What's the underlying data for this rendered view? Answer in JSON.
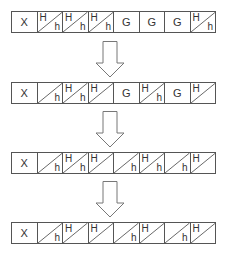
{
  "diagram": {
    "rows": [
      {
        "cells": [
          {
            "type": "full",
            "label": "X"
          },
          {
            "type": "split",
            "upper": "H",
            "lower": "h"
          },
          {
            "type": "split",
            "upper": "H",
            "lower": "h"
          },
          {
            "type": "split",
            "upper": "H",
            "lower": "h"
          },
          {
            "type": "full",
            "label": "G"
          },
          {
            "type": "full",
            "label": "G"
          },
          {
            "type": "full",
            "label": "G"
          },
          {
            "type": "split",
            "upper": "H",
            "lower": "h"
          }
        ]
      },
      {
        "cells": [
          {
            "type": "full",
            "label": "X"
          },
          {
            "type": "split",
            "upper": "",
            "lower": "h"
          },
          {
            "type": "split",
            "upper": "H",
            "lower": "h"
          },
          {
            "type": "split",
            "upper": "H",
            "lower": ""
          },
          {
            "type": "full",
            "label": "G"
          },
          {
            "type": "split",
            "upper": "H",
            "lower": "h"
          },
          {
            "type": "full",
            "label": "G"
          },
          {
            "type": "split",
            "upper": "H",
            "lower": ""
          }
        ]
      },
      {
        "cells": [
          {
            "type": "full",
            "label": "X"
          },
          {
            "type": "split",
            "upper": "",
            "lower": "h"
          },
          {
            "type": "split",
            "upper": "H",
            "lower": "h"
          },
          {
            "type": "split",
            "upper": "H",
            "lower": ""
          },
          {
            "type": "split",
            "upper": "",
            "lower": "h"
          },
          {
            "type": "split",
            "upper": "H",
            "lower": "h"
          },
          {
            "type": "split",
            "upper": "",
            "lower": "h"
          },
          {
            "type": "split",
            "upper": "H",
            "lower": ""
          }
        ]
      },
      {
        "cells": [
          {
            "type": "full",
            "label": "X"
          },
          {
            "type": "split",
            "upper": "",
            "lower": "h"
          },
          {
            "type": "split",
            "upper": "H",
            "lower": ""
          },
          {
            "type": "split",
            "upper": "H",
            "lower": ""
          },
          {
            "type": "split",
            "upper": "",
            "lower": "h"
          },
          {
            "type": "split",
            "upper": "H",
            "lower": ""
          },
          {
            "type": "split",
            "upper": "",
            "lower": "h"
          },
          {
            "type": "split",
            "upper": "H",
            "lower": ""
          }
        ]
      }
    ],
    "arrows": [
      {
        "direction": "down"
      },
      {
        "direction": "down"
      },
      {
        "direction": "down"
      }
    ]
  }
}
